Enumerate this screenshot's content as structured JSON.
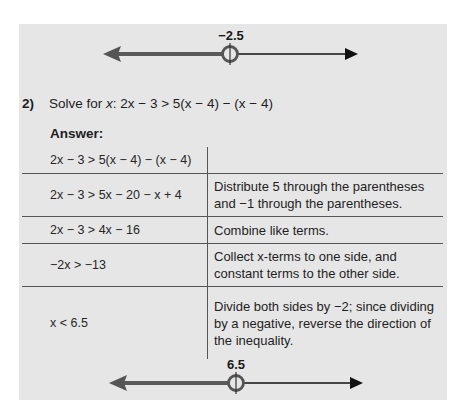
{
  "document": {
    "panel_color": "#e6e6e6",
    "number_line_top": {
      "label": "−2.5",
      "value": -2.5,
      "point_type": "open-circle",
      "shaded_direction": "left",
      "line_color_shaded": "#555555",
      "line_color_plain": "#111111"
    },
    "problem": {
      "number": "2)",
      "prompt_prefix": "Solve for ",
      "variable": "x",
      "prompt_suffix": ": 2x − 3 > 5(x − 4) − (x − 4)",
      "full_text": "Solve for x: 2x − 3 > 5(x − 4) − (x − 4)"
    },
    "answer_label": "Answer:",
    "steps": [
      {
        "equation": "2x − 3 > 5(x − 4) − (x − 4)",
        "explanation": ""
      },
      {
        "equation": "2x − 3 > 5x − 20 − x + 4",
        "explanation": "Distribute 5 through the parentheses and −1 through the parentheses."
      },
      {
        "equation": "2x − 3 > 4x − 16",
        "explanation": "Combine like terms."
      },
      {
        "equation": "−2x > −13",
        "explanation": "Collect x-terms to one side, and constant terms to the other side."
      },
      {
        "equation": "x < 6.5",
        "explanation": "Divide both sides by −2; since dividing by a negative, reverse the direction of the inequality."
      }
    ],
    "number_line_bottom": {
      "label": "6.5",
      "value": 6.5,
      "point_type": "open-circle",
      "shaded_direction": "left",
      "line_color_shaded": "#555555",
      "line_color_plain": "#111111"
    }
  }
}
